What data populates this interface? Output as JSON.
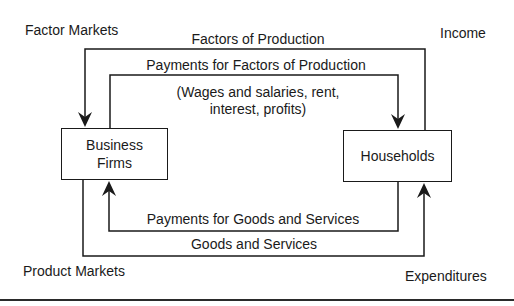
{
  "diagram": {
    "type": "circular-flow",
    "corners": {
      "top_left": "Factor Markets",
      "top_right": "Income",
      "bottom_left": "Product Markets",
      "bottom_right": "Expenditures"
    },
    "nodes": {
      "business": {
        "line1": "Business",
        "line2": "Firms"
      },
      "households": {
        "label": "Households"
      }
    },
    "flows": {
      "outer_top": {
        "label": "Factors of Production",
        "from": "Households",
        "to": "Business Firms"
      },
      "inner_top": {
        "label": "Payments for Factors of Production",
        "note_line1": "(Wages and salaries, rent,",
        "note_line2": "interest, profits)",
        "from": "Business Firms",
        "to": "Households"
      },
      "inner_bottom": {
        "label": "Payments for Goods and Services",
        "from": "Households",
        "to": "Business Firms"
      },
      "outer_bottom": {
        "label": "Goods and Services",
        "from": "Business Firms",
        "to": "Households"
      }
    },
    "colors": {
      "line": "#1a1a1a",
      "background": "#ffffff"
    }
  }
}
